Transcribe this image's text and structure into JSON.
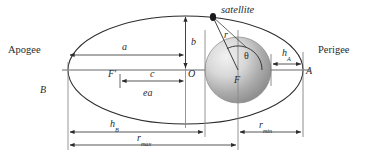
{
  "figure": {
    "type": "orbital-geometry-diagram",
    "background_color": "#ffffff",
    "stroke_color": "#2b2b2b",
    "axis_color": "#9a9a9a",
    "earth_fill_light": "#e8e8e8",
    "earth_fill_dark": "#8d8d8d"
  },
  "labels": {
    "apogee": "Apogee",
    "perigee": "Perigee",
    "satellite": "satellite",
    "semi_major": "a",
    "semi_minor": "b",
    "focal_distance": "c",
    "eccentricity_times_a": "ea",
    "radius": "r",
    "true_anomaly": "θ",
    "focus_primary": "F",
    "focus_secondary": "F'",
    "center": "O",
    "apogee_point": "B",
    "perigee_point": "A",
    "altitude_perigee_base": "h",
    "altitude_perigee_sub": "A",
    "altitude_apogee_base": "h",
    "altitude_apogee_sub": "B",
    "r_max_base": "r",
    "r_max_sub": "max",
    "r_min_base": "r",
    "r_min_sub": "min"
  },
  "geometry": {
    "ellipse": {
      "cx": 185.5,
      "cy": 70,
      "rx": 117.5,
      "ry": 54
    },
    "earth": {
      "cx": 238,
      "cy": 70,
      "r": 33
    },
    "satellite_point": {
      "x": 213,
      "y": 17
    },
    "apogee_x": 68,
    "perigee_x": 303,
    "center_x": 185.5,
    "focus2_x": 120,
    "axis_y": 70
  },
  "dimensions": [
    {
      "name": "a",
      "from_x": 68,
      "to_x": 185.5,
      "y": 49,
      "label": "a"
    },
    {
      "name": "b",
      "x": 185.5,
      "from_y": 15,
      "to_y": 70,
      "label": "b"
    },
    {
      "name": "c",
      "from_x": 120,
      "to_x": 185.5,
      "y": 81,
      "label": "c"
    },
    {
      "name": "h_A",
      "from_x": 271,
      "to_x": 303,
      "y": 60,
      "label": "hA"
    },
    {
      "name": "h_B",
      "from_x": 68,
      "to_x": 205,
      "y": 132,
      "label": "hB"
    },
    {
      "name": "r_max",
      "from_x": 68,
      "to_x": 238,
      "y": 145,
      "label": "rmax"
    },
    {
      "name": "r_min",
      "from_x": 238,
      "to_x": 303,
      "y": 132,
      "label": "rmin"
    }
  ]
}
